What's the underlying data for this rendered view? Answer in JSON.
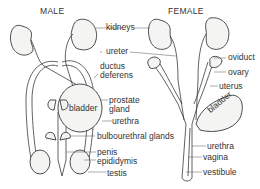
{
  "diagram": {
    "titles": {
      "male": "MALE",
      "female": "FEMALE"
    },
    "shared_labels": {
      "kidneys": "kidneys",
      "ureter": "ureter",
      "bulbourethral_glands": "bulbourethral glands"
    },
    "male_labels": {
      "ductus_deferens_1": "ductus",
      "ductus_deferens_2": "deferens",
      "bladder": "bladder",
      "prostate_gland_1": "prostate",
      "prostate_gland_2": "gland",
      "urethra": "urethra",
      "penis": "penis",
      "epididymis": "epididymis",
      "testis": "testis"
    },
    "female_labels": {
      "oviduct": "oviduct",
      "ovary": "ovary",
      "uterus": "uterus",
      "bladder": "bladder",
      "urethra": "urethra",
      "vagina": "vagina",
      "vestibule": "vestibule"
    },
    "colors": {
      "line": "#3a3a3a",
      "organ_fill": "#f4f4f2",
      "shade": "#9a9a9a"
    }
  }
}
